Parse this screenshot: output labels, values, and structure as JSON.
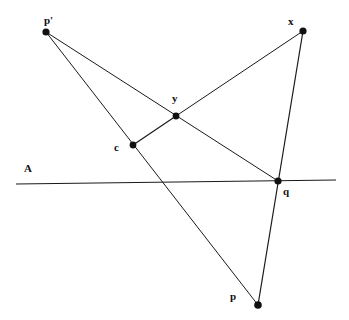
{
  "figure": {
    "kind": "geometry-diagram",
    "background_color": "#ffffff",
    "stroke_color": "#1a1a1a",
    "width": 349,
    "height": 320
  },
  "labels": {
    "p_prime": "p'",
    "x": "x",
    "y": "y",
    "c": "c",
    "q": "q",
    "p": "p",
    "line_a": "A"
  },
  "points": [
    {
      "id": "p_prime",
      "label": "p'",
      "x": 46,
      "y": 32,
      "label_x": 44,
      "label_y": 15
    },
    {
      "id": "x",
      "label": "x",
      "x": 303,
      "y": 31,
      "label_x": 288,
      "label_y": 16
    },
    {
      "id": "y",
      "label": "y",
      "x": 176,
      "y": 116,
      "label_x": 172,
      "label_y": 93
    },
    {
      "id": "c",
      "label": "c",
      "x": 133,
      "y": 145,
      "label_x": 114,
      "label_y": 142
    },
    {
      "id": "q",
      "label": "q",
      "x": 278,
      "y": 181,
      "label_x": 283,
      "label_y": 186
    },
    {
      "id": "p",
      "label": "p",
      "x": 258,
      "y": 305,
      "label_x": 230,
      "label_y": 291
    }
  ],
  "segments": [
    {
      "id": "seg-pprime-q",
      "from": "p'",
      "through": "y",
      "to": "q",
      "x1": 46,
      "y1": 32,
      "x2": 278,
      "y2": 181
    },
    {
      "id": "seg-pprime-p",
      "from": "p'",
      "through": "c",
      "to": "p",
      "x1": 46,
      "y1": 32,
      "x2": 258,
      "y2": 305
    },
    {
      "id": "seg-x-y",
      "from": "x",
      "through": "",
      "to": "y",
      "x1": 303,
      "y1": 31,
      "x2": 176,
      "y2": 116
    },
    {
      "id": "seg-x-p",
      "from": "x",
      "through": "q",
      "to": "p",
      "x1": 303,
      "y1": 31,
      "x2": 258,
      "y2": 305
    },
    {
      "id": "seg-c-y",
      "from": "c",
      "through": "",
      "to": "y",
      "x1": 133,
      "y1": 145,
      "x2": 176,
      "y2": 116
    }
  ],
  "line_a": {
    "id": "line-a",
    "label": "A",
    "x1": 16,
    "y1": 184,
    "x2": 336,
    "y2": 180,
    "label_x": 24,
    "label_y": 163
  }
}
